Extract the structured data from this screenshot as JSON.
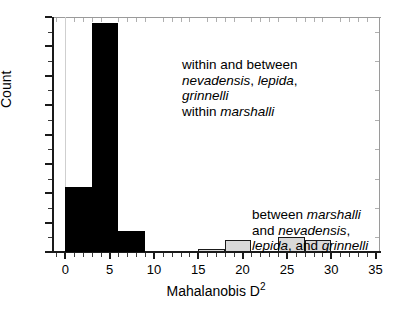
{
  "chart_data": {
    "type": "bar",
    "title": "",
    "subtitle": "",
    "xlabel": "Mahalanobis D²",
    "ylabel": "Count",
    "xlim": [
      -1.5,
      35.5
    ],
    "ylim": [
      0,
      80
    ],
    "grid": false,
    "legend": "none (inline text annotations)",
    "x_ticks": [
      0,
      5,
      10,
      15,
      20,
      25,
      30,
      35
    ],
    "x_tick_labels": [
      "0",
      "5",
      "10",
      "15",
      "20",
      "25",
      "30",
      "35"
    ],
    "x_minor_tick_step": 1,
    "y_ticks": [
      0,
      10,
      20,
      30,
      40,
      50,
      60,
      70,
      80
    ],
    "y_tick_labels": [
      "0",
      "10",
      "20",
      "30",
      "40",
      "50",
      "60",
      "70",
      "80"
    ],
    "y_minor_tick_step": 5,
    "bin_width": 3,
    "series": [
      {
        "name": "within and between nevadensis, lepida, grinnelli; within marshalli",
        "color": "#000000",
        "bins": [
          {
            "x0": 0,
            "x1": 3,
            "value": 22
          },
          {
            "x0": 3,
            "x1": 6,
            "value": 78
          },
          {
            "x0": 6,
            "x1": 9,
            "value": 7
          }
        ]
      },
      {
        "name": "between marshalli and nevadensis, lepida, and grinnelli",
        "color": "#d9d9d9",
        "bins": [
          {
            "x0": 15,
            "x1": 18,
            "value": 1
          },
          {
            "x0": 18,
            "x1": 21,
            "value": 4
          },
          {
            "x0": 24,
            "x1": 27,
            "value": 5
          },
          {
            "x0": 27,
            "x1": 30,
            "value": 4
          }
        ]
      }
    ],
    "annotations": [
      {
        "id": "within",
        "lines": [
          [
            {
              "t": "within and between",
              "i": false
            }
          ],
          [
            {
              "t": "nevadensis",
              "i": true
            },
            {
              "t": ", ",
              "i": false
            },
            {
              "t": "lepida",
              "i": true
            },
            {
              "t": ",",
              "i": false
            }
          ],
          [
            {
              "t": "grinnelli",
              "i": true
            }
          ],
          [
            {
              "t": "within ",
              "i": false
            },
            {
              "t": "marshalli",
              "i": true
            }
          ]
        ]
      },
      {
        "id": "between",
        "lines": [
          [
            {
              "t": "between ",
              "i": false
            },
            {
              "t": "marshalli",
              "i": true
            }
          ],
          [
            {
              "t": "and ",
              "i": false
            },
            {
              "t": "nevadensis",
              "i": true
            },
            {
              "t": ",",
              "i": false
            }
          ],
          [
            {
              "t": "lepida",
              "i": true
            },
            {
              "t": ", and ",
              "i": false
            },
            {
              "t": "grinnelli",
              "i": true
            }
          ]
        ]
      }
    ]
  }
}
